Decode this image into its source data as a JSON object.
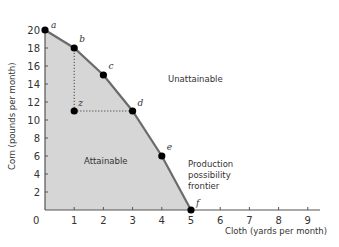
{
  "chart_data": {
    "type": "line",
    "title": "",
    "xlabel": "Cloth (yards per month)",
    "ylabel": "Corn (pounds per month)",
    "xlim": [
      0,
      9
    ],
    "ylim": [
      0,
      20
    ],
    "x_ticks": [
      0,
      1,
      2,
      3,
      4,
      5,
      6,
      7,
      8,
      9
    ],
    "y_ticks": [
      2,
      4,
      6,
      8,
      10,
      12,
      14,
      16,
      18,
      20
    ],
    "grid": false,
    "series": [
      {
        "name": "Production possibility frontier",
        "points": [
          {
            "label": "a",
            "x": 0,
            "y": 20
          },
          {
            "label": "b",
            "x": 1,
            "y": 18
          },
          {
            "label": "c",
            "x": 2,
            "y": 15
          },
          {
            "label": "d",
            "x": 3,
            "y": 11
          },
          {
            "label": "e",
            "x": 4,
            "y": 6
          },
          {
            "label": "f",
            "x": 5,
            "y": 0
          }
        ]
      }
    ],
    "extra_points": [
      {
        "label": "z",
        "x": 1,
        "y": 11
      }
    ],
    "annotations": [
      {
        "text": "Unattainable",
        "x": 4.2,
        "y": 13.5
      },
      {
        "text": "Attainable",
        "x": 1.4,
        "y": 5.2
      },
      {
        "text": "Production possibility frontier",
        "x": 5.3,
        "y": 5
      }
    ],
    "colors": {
      "frontier": "#6b6b6b",
      "attainable_fill": "#d6d6d6",
      "points": "#000000",
      "axis": "#555555"
    }
  },
  "labels": {
    "x_axis": "Cloth (yards per month)",
    "y_axis": "Corn (pounds per month)",
    "unattainable": "Unattainable",
    "attainable": "Attainable",
    "ppf_line1": "Production",
    "ppf_line2": "possibility",
    "ppf_line3": "frontier",
    "origin": "0"
  }
}
